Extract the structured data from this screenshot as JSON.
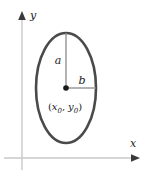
{
  "figure": {
    "type": "ellipse-diagram",
    "background_color": "#ffffff"
  },
  "axes": {
    "color": "#c9c9c9",
    "arrow_color": "#3a3a3a",
    "x_axis": {
      "label": "x",
      "y_position": 158,
      "x_start": 4,
      "x_end": 140
    },
    "y_axis": {
      "label": "y",
      "x_position": 22,
      "y_start": 168,
      "y_end": 12
    }
  },
  "ellipse": {
    "center_label_prefix": "(",
    "center_label_x": "x",
    "center_label_x_sub": "0",
    "center_label_separator": ",",
    "center_label_y": "y",
    "center_label_y_sub": "0",
    "center_label_suffix": ")",
    "center_label_full": "(x0, y0)",
    "stroke_color": "#4a4a4a",
    "stroke_width": 2.6,
    "fill": "none",
    "center_x": 66,
    "center_y": 88,
    "semi_axis_vertical": 55,
    "semi_axis_horizontal": 30
  },
  "radii": {
    "vertical": {
      "label": "a",
      "color": "#8a8a8a",
      "from_x": 66,
      "from_y": 88,
      "to_x": 66,
      "to_y": 33
    },
    "horizontal": {
      "label": "b",
      "color": "#8a8a8a",
      "from_x": 66,
      "from_y": 88,
      "to_x": 96,
      "to_y": 88
    }
  },
  "center_point": {
    "name": "center-dot",
    "color": "#1a1a1a",
    "radius": 2.8
  }
}
